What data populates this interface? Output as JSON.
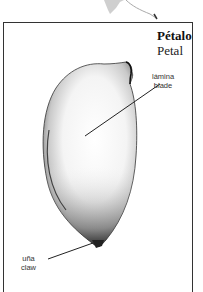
{
  "figure": {
    "title_es": "Pétalo",
    "title_en": "Petal"
  },
  "labels": {
    "blade": {
      "es": "lámina",
      "en": "blade"
    },
    "claw": {
      "es": "uña",
      "en": "claw"
    }
  },
  "colors": {
    "frame": "#333333",
    "ink": "#222222",
    "background": "#ffffff"
  }
}
